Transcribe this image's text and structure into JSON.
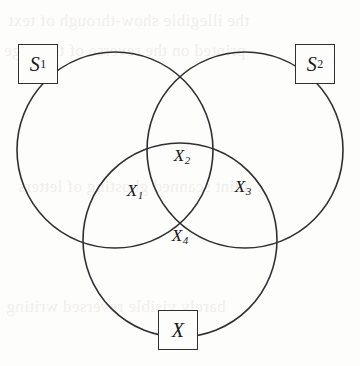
{
  "figure": {
    "type": "venn-diagram",
    "background_color": "#fdfdfb",
    "stroke_color": "#2f2f33",
    "text_color": "#17171a"
  },
  "circles": [
    {
      "name": "left-circle",
      "cx": 115,
      "cy": 150,
      "r": 98
    },
    {
      "name": "right-circle",
      "cx": 245,
      "cy": 150,
      "r": 98
    },
    {
      "name": "bottom-circle",
      "cx": 180,
      "cy": 240,
      "r": 97
    }
  ],
  "nodes": [
    {
      "id": "s1",
      "base": "S",
      "subscript": "1",
      "left": 18,
      "top": 44
    },
    {
      "id": "s2",
      "base": "S",
      "subscript": "2",
      "left": 295,
      "top": 44
    },
    {
      "id": "x",
      "base": "X",
      "subscript": "",
      "left": 158,
      "top": 310
    }
  ],
  "regions": [
    {
      "id": "x1",
      "base": "X",
      "subscript": "1",
      "x": 135,
      "y": 192
    },
    {
      "id": "x2",
      "base": "X",
      "subscript": "2",
      "x": 182,
      "y": 157
    },
    {
      "id": "x3",
      "base": "X",
      "subscript": "3",
      "x": 243,
      "y": 188
    },
    {
      "id": "x4",
      "base": "X",
      "subscript": "4",
      "x": 180,
      "y": 237
    }
  ],
  "background_bleed": [
    {
      "text": "the illegible show-through of text",
      "x": 8,
      "y": 4
    },
    {
      "text": "printed on the reverse of the page",
      "x": 4,
      "y": 34
    },
    {
      "text": "faint scanned ghosting of letters",
      "x": 18,
      "y": 170
    },
    {
      "text": "barely visible reversed writing",
      "x": 6,
      "y": 290
    }
  ]
}
